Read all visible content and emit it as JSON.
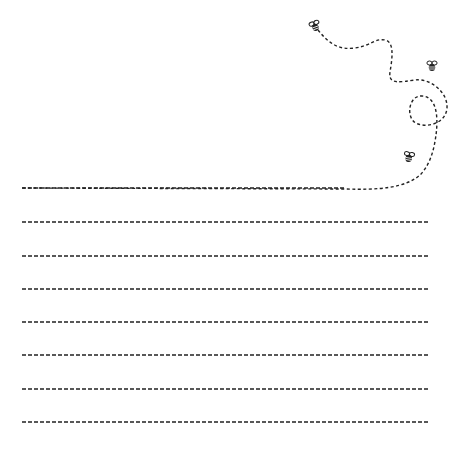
{
  "page": {
    "background": "#ffffff",
    "ink_color": "#222222"
  },
  "writing_lines": {
    "count": 8,
    "x_start": 22,
    "x_end": 430,
    "y_positions": [
      188,
      222,
      256,
      289,
      322,
      355,
      389,
      422
    ],
    "dash_pattern": "4 2"
  },
  "flight_path": {
    "description": "dashed bee flight trail curving from top bee down and looping into the first line",
    "d": "M318 30 C 330 45, 340 50, 355 48 C 370 46, 375 38, 385 40 C 395 42, 392 60, 390 72 C 388 85, 400 82, 415 80 C 430 78, 448 92, 447 108 C 446 122, 430 128, 418 124 C 405 120, 408 95, 422 96 C 438 97, 438 120, 436 135 C 434 150, 430 165, 420 175 C 405 188, 380 190, 345 189 L 22 188"
  },
  "bees": [
    {
      "name": "bee-top",
      "x": 315,
      "y": 26,
      "rotate": -20
    },
    {
      "name": "bee-right",
      "x": 432,
      "y": 66,
      "rotate": 0
    },
    {
      "name": "bee-bottom",
      "x": 409,
      "y": 157,
      "rotate": 10
    }
  ]
}
